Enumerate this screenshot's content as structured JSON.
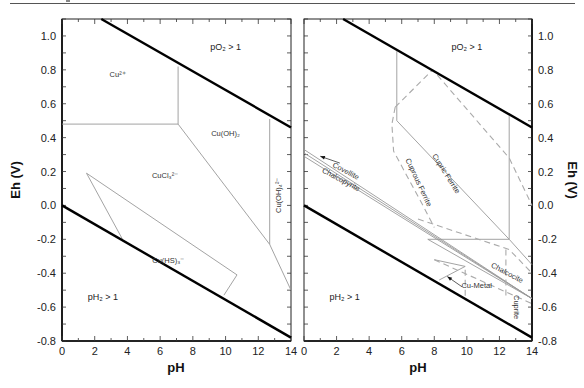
{
  "chart_data": [
    {
      "type": "line",
      "panel": "left",
      "title": "",
      "xlabel": "pH",
      "ylabel": "Eh (V)",
      "xlim": [
        0,
        14
      ],
      "ylim": [
        -0.8,
        1.1
      ],
      "x_ticks": [
        "0",
        "2",
        "4",
        "6",
        "8",
        "10",
        "12",
        "14"
      ],
      "y_ticks": [
        "-0.8",
        "-0.6",
        "-0.4",
        "-0.2",
        "0.0",
        "0.2",
        "0.4",
        "0.6",
        "0.8",
        "1.0"
      ],
      "y_axis_side": "left",
      "grid": false,
      "water_limits": {
        "upper": {
          "name": "pO2 = 1",
          "points": [
            [
              2.4,
              1.1
            ],
            [
              14,
              0.46
            ]
          ]
        },
        "lower": {
          "name": "pH2 = 1",
          "points": [
            [
              0,
              0.0
            ],
            [
              14,
              -0.78
            ]
          ]
        }
      },
      "boundaries": [
        {
          "points": [
            [
              0,
              0.48
            ],
            [
              7.1,
              0.48
            ]
          ]
        },
        {
          "points": [
            [
              7.1,
              0.82
            ],
            [
              7.1,
              0.48
            ]
          ]
        },
        {
          "points": [
            [
              7.1,
              0.48
            ],
            [
              12.7,
              -0.23
            ],
            [
              14,
              -0.5
            ]
          ]
        },
        {
          "points": [
            [
              12.7,
              0.51
            ],
            [
              12.7,
              -0.23
            ]
          ]
        },
        {
          "points": [
            [
              1.5,
              0.19
            ],
            [
              3.7,
              -0.2
            ]
          ]
        },
        {
          "points": [
            [
              1.5,
              0.19
            ],
            [
              10.7,
              -0.41
            ],
            [
              9.9,
              -0.53
            ]
          ]
        }
      ],
      "labels": [
        {
          "text": "pO₂ > 1",
          "x": 10.0,
          "y": 0.92,
          "size": "big"
        },
        {
          "text": "Cu²⁺",
          "x": 3.4,
          "y": 0.76
        },
        {
          "text": "Cu(OH)₂",
          "x": 10.0,
          "y": 0.41
        },
        {
          "text": "CuCl₃²⁻",
          "x": 6.3,
          "y": 0.16
        },
        {
          "text": "Cu(OH)₄²⁻",
          "x": 13.4,
          "y": 0.06,
          "rotate": -90
        },
        {
          "text": "Cu(HS)₃⁻",
          "x": 6.5,
          "y": -0.34
        },
        {
          "text": "pH₂ > 1",
          "x": 2.5,
          "y": -0.56,
          "size": "big"
        }
      ]
    },
    {
      "type": "line",
      "panel": "right",
      "title": "",
      "xlabel": "pH",
      "ylabel": "Eh (V)",
      "xlim": [
        0,
        14
      ],
      "ylim": [
        -0.8,
        1.1
      ],
      "x_ticks": [
        "0",
        "2",
        "4",
        "6",
        "8",
        "10",
        "12",
        "14"
      ],
      "y_ticks": [
        "-0.8",
        "-0.6",
        "-0.4",
        "-0.2",
        "0.0",
        "0.2",
        "0.4",
        "0.6",
        "0.8",
        "1.0"
      ],
      "y_axis_side": "right",
      "grid": false,
      "water_limits": {
        "upper": {
          "name": "pO2 = 1",
          "points": [
            [
              2.4,
              1.1
            ],
            [
              14,
              0.46
            ]
          ]
        },
        "lower": {
          "name": "pH2 = 1",
          "points": [
            [
              0,
              0.0
            ],
            [
              14,
              -0.78
            ]
          ]
        }
      },
      "boundaries": [
        {
          "points": [
            [
              5.7,
              0.91
            ],
            [
              5.7,
              0.5
            ],
            [
              12.6,
              -0.2
            ],
            [
              12.6,
              0.53
            ]
          ],
          "style": "solid"
        },
        {
          "points": [
            [
              12.6,
              -0.2
            ],
            [
              14,
              -0.35
            ]
          ],
          "style": "solid"
        },
        {
          "points": [
            [
              7.6,
              -0.2
            ],
            [
              12.6,
              -0.2
            ]
          ],
          "style": "solid"
        },
        {
          "points": [
            [
              0,
              0.33
            ],
            [
              14,
              -0.55
            ]
          ],
          "style": "solid"
        },
        {
          "points": [
            [
              0,
              0.31
            ],
            [
              14,
              -0.55
            ]
          ],
          "style": "solid"
        },
        {
          "points": [
            [
              0,
              0.29
            ],
            [
              14,
              -0.55
            ]
          ],
          "style": "solid"
        },
        {
          "points": [
            [
              7.6,
              -0.2
            ],
            [
              14,
              -0.55
            ]
          ],
          "style": "solid"
        },
        {
          "points": [
            [
              8.3,
              -0.44
            ],
            [
              9.9,
              -0.36
            ],
            [
              8.0,
              -0.32
            ]
          ],
          "style": "solid"
        },
        {
          "points": [
            [
              5.6,
              0.58
            ],
            [
              7.9,
              0.8
            ],
            [
              12.6,
              0.28
            ],
            [
              14,
              -0.0
            ]
          ],
          "style": "dashed"
        },
        {
          "points": [
            [
              5.6,
              0.58
            ],
            [
              5.4,
              0.48
            ],
            [
              5.5,
              0.32
            ],
            [
              7.3,
              -0.0
            ],
            [
              8.0,
              -0.13
            ]
          ],
          "style": "dashed"
        },
        {
          "points": [
            [
              7.0,
              -0.08
            ],
            [
              12.6,
              -0.26
            ],
            [
              14,
              -0.4
            ]
          ],
          "style": "dashed"
        },
        {
          "points": [
            [
              12.4,
              -0.26
            ],
            [
              12.4,
              -0.55
            ]
          ],
          "style": "dashed"
        },
        {
          "points": [
            [
              9.9,
              -0.38
            ],
            [
              9.9,
              -0.56
            ]
          ],
          "style": "dashed"
        },
        {
          "points": [
            [
              8.0,
              -0.32
            ],
            [
              14,
              -0.58
            ]
          ],
          "style": "dashed"
        }
      ],
      "labels": [
        {
          "text": "pO₂ > 1",
          "x": 10.0,
          "y": 0.92,
          "size": "big"
        },
        {
          "text": "Covellite",
          "x": 2.5,
          "y": 0.19,
          "rotate": 28
        },
        {
          "text": "Chalcopyrite",
          "x": 2.2,
          "y": 0.14,
          "rotate": 28
        },
        {
          "text": "Cupric Ferrite",
          "x": 8.6,
          "y": 0.18,
          "rotate": 58
        },
        {
          "text": "Cuprous Ferrite",
          "x": 6.9,
          "y": 0.13,
          "rotate": 65
        },
        {
          "text": "Chalcocite",
          "x": 12.4,
          "y": -0.41,
          "rotate": 28
        },
        {
          "text": "Cu-Metal",
          "x": 10.6,
          "y": -0.49
        },
        {
          "text": "Cuprite",
          "x": 12.9,
          "y": -0.6,
          "rotate": 90
        },
        {
          "text": "pH₂ > 1",
          "x": 2.5,
          "y": -0.56,
          "size": "big"
        }
      ],
      "arrows": [
        {
          "from": [
            2.2,
            0.25
          ],
          "to": [
            1.0,
            0.29
          ],
          "label": "Covellite"
        },
        {
          "from": [
            9.7,
            -0.48
          ],
          "to": [
            8.8,
            -0.42
          ],
          "label": "Cu-Metal"
        }
      ]
    }
  ],
  "panels": {
    "left": {
      "x_axis_title": "pH",
      "y_axis_title": "Eh (V)"
    },
    "right": {
      "x_axis_title": "pH",
      "y_axis_title": "Eh (V)"
    }
  }
}
